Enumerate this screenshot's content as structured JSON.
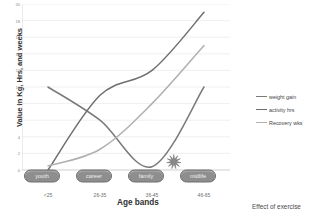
{
  "chart_data": {
    "type": "line",
    "title": "",
    "xlabel": "Age bands",
    "ylabel": "Value in Kg, Hrs, and weeks",
    "categories": [
      "<25",
      "26-35",
      "36-45",
      "46-65"
    ],
    "ylim": [
      0,
      20
    ],
    "ytick_labels": [
      "0",
      "2",
      "4",
      "6",
      "8",
      "10",
      "12",
      "14",
      "16",
      "18",
      "20"
    ],
    "ytick_values": [
      0,
      2,
      4,
      6,
      8,
      10,
      12,
      14,
      16,
      18,
      20
    ],
    "grid": true,
    "legend_position": "right",
    "series": [
      {
        "name": "weight gain",
        "color": "#7a7a7a",
        "values": [
          10,
          6,
          0.4,
          10
        ],
        "points": [
          {
            "x": "<25",
            "y": 10
          },
          {
            "x": "26-35",
            "y": 6
          },
          {
            "x": "36-45",
            "y": 0.4
          },
          {
            "x": "46-65",
            "y": 10
          }
        ]
      },
      {
        "name": "activity hrs",
        "color": "#6f6f6f",
        "values": [
          0,
          9,
          12,
          19
        ],
        "points": [
          {
            "x": "<25",
            "y": 0
          },
          {
            "x": "26-35",
            "y": 9
          },
          {
            "x": "36-45",
            "y": 12
          },
          {
            "x": "46-65",
            "y": 19
          }
        ]
      },
      {
        "name": "Recovery wks",
        "color": "#b0b0b0",
        "values": [
          0.5,
          2.5,
          8,
          15
        ],
        "points": [
          {
            "x": "<25",
            "y": 0.5
          },
          {
            "x": "26-35",
            "y": 2.5
          },
          {
            "x": "36-45",
            "y": 8
          },
          {
            "x": "46-65",
            "y": 15
          }
        ]
      }
    ],
    "annotations": [
      {
        "type": "pill",
        "label": "youth",
        "x": "<25"
      },
      {
        "type": "pill",
        "label": "career",
        "x": "26-35"
      },
      {
        "type": "pill",
        "label": "family",
        "x": "36-45"
      },
      {
        "type": "pill",
        "label": "midlife",
        "x": "46-65"
      },
      {
        "type": "starburst",
        "label": "",
        "near": "weight gain trough"
      }
    ]
  },
  "legend": {
    "items": [
      {
        "label": "weight gain",
        "color": "#7a7a7a"
      },
      {
        "label": "activity hrs",
        "color": "#6f6f6f"
      },
      {
        "label": "Recovery wks",
        "color": "#b0b0b0"
      }
    ]
  },
  "pills": [
    {
      "label": "youth"
    },
    {
      "label": "career"
    },
    {
      "label": "family"
    },
    {
      "label": "midlife"
    }
  ],
  "caption": {
    "text": "Effect of exercise"
  },
  "colors": {
    "weight_gain": "#7a7a7a",
    "activity_hrs": "#6f6f6f",
    "recovery_wks": "#b0b0b0",
    "gridline": "#e4e4e4",
    "axis": "#c9c9c9",
    "pill_fill": "#8e8e8e",
    "background": "#ffffff"
  }
}
